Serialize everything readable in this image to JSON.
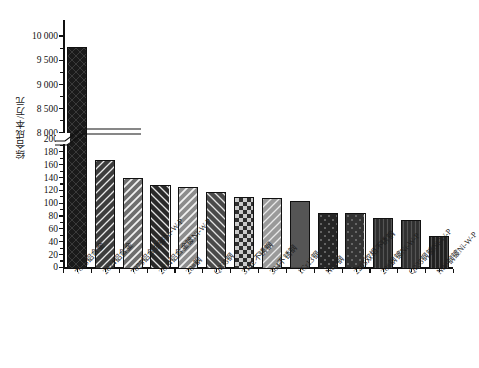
{
  "chart_data": {
    "type": "bar",
    "title": "",
    "xlabel": "",
    "ylabel": "综合成本/万元",
    "grid": false,
    "legend": "none",
    "broken_axis": true,
    "axis_break": {
      "lower_max": 200,
      "upper_min": 8000
    },
    "ylim_lower": [
      0,
      200
    ],
    "ylim_upper": [
      8000,
      10000
    ],
    "yticks_lower": [
      "0",
      "20",
      "40",
      "60",
      "80",
      "100",
      "120",
      "140",
      "160",
      "180",
      "200"
    ],
    "yticks_upper": [
      "8 000",
      "8 500",
      "9 000",
      "9 500",
      "10 000"
    ],
    "categories": [
      "7075铝合金",
      "2024铝合金",
      "7075铝合金镀Ni-W-P",
      "2024铝合金镀Ni-W-P",
      "20#钢",
      "Q235钢",
      "316L不锈钢",
      "304不锈钢",
      "1Cr13钢",
      "N80钢",
      "2205双相不锈钢",
      "20#钢镀Ni-W-P",
      "Q235钢镀Ni-W-P",
      "N80钢镀Ni-W-P"
    ],
    "values": [
      9780,
      168,
      140,
      129,
      126,
      118,
      110,
      108,
      103,
      85,
      84,
      77,
      74,
      49
    ],
    "bar_colors": [
      "#1a1a1a",
      "#3d3d3d",
      "#6e6e6e",
      "#2a2a2a",
      "#8c8c8c",
      "#4a4a4a",
      "#2f2f2f",
      "#9a9a9a",
      "#555555",
      "#262626",
      "#333333",
      "#2d2d2d",
      "#303030",
      "#202020"
    ],
    "hatches": [
      "cross",
      "diag",
      "diag-wide",
      "diag-back",
      "diag-wide",
      "diag-back",
      "checker",
      "diag",
      "solid",
      "dots",
      "dots",
      "vert",
      "vert",
      "vert"
    ]
  }
}
